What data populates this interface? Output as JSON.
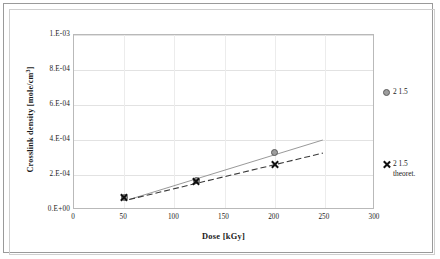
{
  "chart_data": {
    "type": "scatter",
    "title": "",
    "xlabel": "Dose [kGy]",
    "ylabel": "Crosslink density [mole/cm3]",
    "ylabel_base": "Crosslink density [mole/cm",
    "ylabel_sup": "3",
    "ylabel_tail": "]",
    "xlim": [
      0,
      300
    ],
    "ylim": [
      0,
      0.001
    ],
    "xticks": [
      "0",
      "50",
      "100",
      "150",
      "200",
      "250",
      "300"
    ],
    "xtick_values": [
      0,
      50,
      100,
      150,
      200,
      250,
      300
    ],
    "yticks": [
      "0.E+00",
      "2.E-04",
      "4.E-04",
      "6.E-04",
      "8.E-04",
      "1.E-03"
    ],
    "ytick_values": [
      0,
      0.0002,
      0.0004,
      0.0006,
      0.0008,
      0.001
    ],
    "grid": "horizontal-and-vertical",
    "legend_position": "right-outside",
    "series": [
      {
        "name": "2  1.5",
        "marker": "circle",
        "color": "#9d9d9d",
        "line_style": "solid",
        "x": [
          50,
          122,
          200
        ],
        "y": [
          7e-05,
          0.00017,
          0.00033
        ],
        "trend": {
          "x": [
            55,
            248
          ],
          "y": [
            6e-05,
            0.0004
          ]
        }
      },
      {
        "name": "2  1.5\ntheoret.",
        "marker": "cross",
        "color": "#101010",
        "line_style": "dashed",
        "x": [
          50,
          122,
          200
        ],
        "y": [
          7e-05,
          0.000165,
          0.00026
        ],
        "trend": {
          "x": [
            55,
            248
          ],
          "y": [
            6e-05,
            0.000325
          ]
        }
      }
    ]
  },
  "legend": {
    "entries": [
      {
        "label": "2  1.5",
        "marker": "circle"
      },
      {
        "label": "2  1.5\ntheoret.",
        "marker": "cross"
      }
    ]
  }
}
